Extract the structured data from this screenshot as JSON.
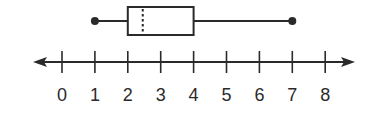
{
  "chart_data": {
    "type": "boxplot",
    "title": "",
    "xlabel": "",
    "ylabel": "",
    "orientation": "horizontal",
    "min": 1,
    "q1": 2,
    "median": 2.5,
    "q3": 4,
    "max": 7,
    "median_style": "dotted",
    "axis": {
      "type": "number-line",
      "range": [
        0,
        8
      ],
      "ticks": [
        0,
        1,
        2,
        3,
        4,
        5,
        6,
        7,
        8
      ],
      "tick_labels": [
        "0",
        "1",
        "2",
        "3",
        "4",
        "5",
        "6",
        "7",
        "8"
      ],
      "arrows": "both"
    },
    "grid": false,
    "colors": {
      "ink": "#2a2a2a",
      "background": "#ffffff"
    }
  }
}
